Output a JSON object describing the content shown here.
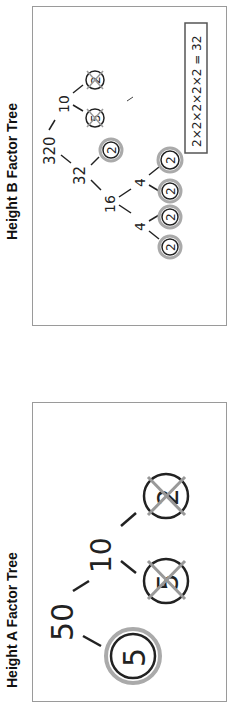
{
  "panels": {
    "height_a": {
      "title": "Height A Factor Tree",
      "tree": {
        "root": "50",
        "children": [
          "5",
          "10"
        ],
        "grandchildren_of_10": [
          "5",
          "2"
        ],
        "circled_primes": [
          "5"
        ],
        "crossed_out": [
          "5",
          "2"
        ]
      },
      "labels": {
        "root": "50",
        "left": "5",
        "mid": "10",
        "leaf1": "5",
        "leaf2": "2"
      }
    },
    "height_b": {
      "title": "Height B Factor Tree",
      "tree": {
        "root": "320",
        "children": [
          "32",
          "10"
        ],
        "factors_of_10": [
          "5",
          "2"
        ],
        "factors_of_32": [
          "16",
          "2"
        ],
        "factors_of_16": [
          "4",
          "4"
        ],
        "factors_of_4a": [
          "2",
          "2"
        ],
        "factors_of_4b": [
          "2",
          "2"
        ]
      },
      "labels": {
        "root": "320",
        "n10": "10",
        "n5": "5",
        "n2a": "2",
        "n32": "32",
        "n2b": "2",
        "n16": "16",
        "n4a": "4",
        "n4b": "4",
        "l1": "2",
        "l2": "2",
        "l3": "2",
        "l4": "2"
      },
      "equation": "2×2×2×2×2 = 32"
    }
  },
  "colors": {
    "ink": "#222222",
    "highlight": "#9a9a9a",
    "border": "#9a9a9a"
  }
}
